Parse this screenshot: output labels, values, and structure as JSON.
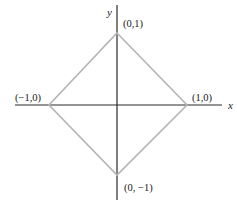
{
  "diagram": {
    "type": "unit-diamond",
    "axes": {
      "x_label": "x",
      "y_label": "y"
    },
    "vertices": {
      "top": {
        "label": "(0,1)",
        "x": 0,
        "y": 1
      },
      "right": {
        "label": "(1,0)",
        "x": 1,
        "y": 0
      },
      "bottom": {
        "label": "(0, −1)",
        "x": 0,
        "y": -1
      },
      "left": {
        "label": "(−1,0)",
        "x": -1,
        "y": 0
      }
    },
    "colors": {
      "axis": "#2a2a2a",
      "diamond": "#b5b5b5",
      "text": "#1a1a1a"
    }
  }
}
